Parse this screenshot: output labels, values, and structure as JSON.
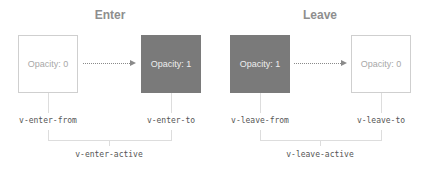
{
  "enter": {
    "heading": "Enter",
    "from_box": "Opacity: 0",
    "to_box": "Opacity: 1",
    "from_class": "v-enter-from",
    "to_class": "v-enter-to",
    "active_class": "v-enter-active"
  },
  "leave": {
    "heading": "Leave",
    "from_box": "Opacity: 1",
    "to_box": "Opacity: 0",
    "from_class": "v-leave-from",
    "to_class": "v-leave-to",
    "active_class": "v-leave-active"
  },
  "colors": {
    "dark_box": "#7a7a7a",
    "light_box_border": "#cfcfcf",
    "heading": "#8e8e8e",
    "arrow": "#8a8a8a",
    "connector": "#dddddd"
  }
}
